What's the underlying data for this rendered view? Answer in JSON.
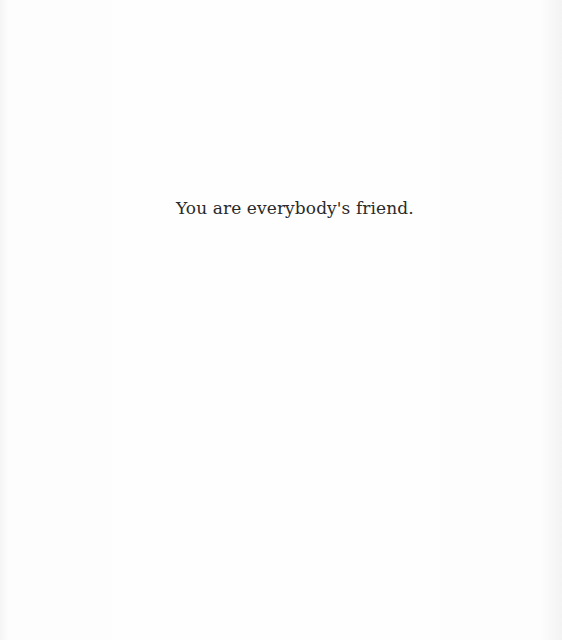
{
  "page": {
    "text_line": "You are everybody's friend."
  }
}
